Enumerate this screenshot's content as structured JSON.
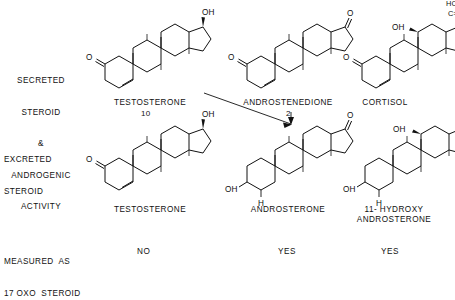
{
  "figure": {
    "title_rows": {
      "secreted": "SECRETED\nSTEROID\n&\nANDROGENIC\nACTIVITY",
      "excreted": "EXCRETED\nSTEROID",
      "measured": "MEASURED AS\n17 OXO STEROID"
    }
  },
  "row_labels": {
    "secreted_l1": "SECRETED",
    "secreted_l2": "STEROID",
    "secreted_l3": "&",
    "secreted_l4": "ANDROGENIC",
    "secreted_l5": "ACTIVITY",
    "excreted_l1": "EXCRETED",
    "excreted_l2": "STEROID",
    "measured_l1": "MEASURED  AS",
    "measured_l2": "17 OXO  STEROID"
  },
  "columns": [
    {
      "secreted_name": "TESTOSTERONE",
      "secreted_marker": "10",
      "excreted_name": "TESTOSTERONE",
      "measured": "NO"
    },
    {
      "secreted_name": "ANDROSTENEDIONE",
      "secreted_marker": "2",
      "excreted_name": "ANDROSTERONE",
      "measured": "YES"
    },
    {
      "secreted_name": "CORTISOL",
      "secreted_marker": "",
      "excreted_name": "11- HYDROXY\nANDROSTERONE",
      "measured": "YES"
    }
  ],
  "atoms": {
    "oh": "OH",
    "o": "O",
    "h": "H",
    "hcoh": "HCOH",
    "co": "C=O"
  },
  "colors": {
    "ink": "#111111",
    "paper": "#ffffff"
  }
}
